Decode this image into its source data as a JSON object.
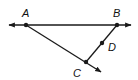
{
  "diagram": {
    "type": "geometry",
    "points": [
      {
        "name": "A",
        "x": 26,
        "y": 25,
        "label_x": 22,
        "label_y": 17
      },
      {
        "name": "B",
        "x": 117,
        "y": 25,
        "label_x": 113,
        "label_y": 17
      },
      {
        "name": "D",
        "x": 102,
        "y": 43,
        "label_x": 108,
        "label_y": 51
      },
      {
        "name": "C",
        "x": 86,
        "y": 62,
        "label_x": 73,
        "label_y": 77
      }
    ],
    "labels": {
      "A": "A",
      "B": "B",
      "C": "C",
      "D": "D"
    },
    "elements": [
      {
        "kind": "line",
        "through": [
          "A",
          "B"
        ],
        "note": "arrows both ends"
      },
      {
        "kind": "ray",
        "from": "A",
        "through": "C"
      },
      {
        "kind": "segment",
        "from": "B",
        "to": "C",
        "contains": "D"
      }
    ],
    "stroke_color": "#1a1a1a"
  }
}
